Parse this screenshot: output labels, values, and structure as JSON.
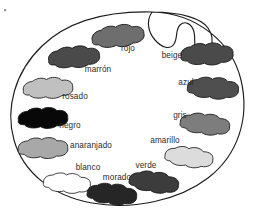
{
  "figure": {
    "name": "artist-paint-palette",
    "background_color": "#ffffff",
    "outline_color": "#1d1d1d",
    "body_fill": "#ffffff",
    "label_color": "#2b2b2b"
  },
  "paints": [
    {
      "id": "rojo",
      "label": "rojo",
      "swatch_color": "#6e6e6e",
      "outline_color": "#1a1a1a",
      "label_x": 128,
      "label_y": 51,
      "label_anchor": "middle",
      "blob_cx": 118,
      "blob_cy": 36,
      "blob_rot": -8,
      "blob_scale": 1.0
    },
    {
      "id": "marron",
      "label": "marrón",
      "swatch_color": "#4a4a4a",
      "outline_color": "#1a1a1a",
      "label_x": 98,
      "label_y": 72,
      "label_anchor": "middle",
      "blob_cx": 74,
      "blob_cy": 57,
      "blob_rot": -6,
      "blob_scale": 0.98
    },
    {
      "id": "rosado",
      "label": "rosado",
      "swatch_color": "#c0c0c0",
      "outline_color": "#1a1a1a",
      "label_x": 75,
      "label_y": 99,
      "label_anchor": "middle",
      "blob_cx": 48,
      "blob_cy": 88,
      "blob_rot": -4,
      "blob_scale": 0.95
    },
    {
      "id": "negro",
      "label": "negro",
      "swatch_color": "#080808",
      "outline_color": "#080808",
      "label_x": 70,
      "label_y": 128,
      "label_anchor": "middle",
      "blob_cx": 43,
      "blob_cy": 118,
      "blob_rot": -3,
      "blob_scale": 0.95
    },
    {
      "id": "anaranjado",
      "label": "anaranjado",
      "swatch_color": "#a8a8a8",
      "outline_color": "#1a1a1a",
      "label_x": 91,
      "label_y": 148,
      "label_anchor": "middle",
      "blob_cx": 43,
      "blob_cy": 148,
      "blob_rot": -2,
      "blob_scale": 0.95
    },
    {
      "id": "blanco",
      "label": "blanco",
      "swatch_color": "#ffffff",
      "outline_color": "#1a1a1a",
      "label_x": 88,
      "label_y": 170,
      "label_anchor": "middle",
      "blob_cx": 67,
      "blob_cy": 183,
      "blob_rot": 3,
      "blob_scale": 0.9
    },
    {
      "id": "morado",
      "label": "morado",
      "swatch_color": "#262626",
      "outline_color": "#1a1a1a",
      "label_x": 117,
      "label_y": 180,
      "label_anchor": "middle",
      "blob_cx": 112,
      "blob_cy": 194,
      "blob_rot": 4,
      "blob_scale": 0.95
    },
    {
      "id": "verde",
      "label": "verde",
      "swatch_color": "#3c3c3c",
      "outline_color": "#1a1a1a",
      "label_x": 146,
      "label_y": 168,
      "label_anchor": "middle",
      "blob_cx": 154,
      "blob_cy": 182,
      "blob_rot": 6,
      "blob_scale": 0.95
    },
    {
      "id": "amarillo",
      "label": "amarillo",
      "swatch_color": "#dcdcdc",
      "outline_color": "#1a1a1a",
      "label_x": 165,
      "label_y": 143,
      "label_anchor": "middle",
      "blob_cx": 189,
      "blob_cy": 157,
      "blob_rot": 5,
      "blob_scale": 0.92
    },
    {
      "id": "gris",
      "label": "gris",
      "swatch_color": "#7d7d7d",
      "outline_color": "#1a1a1a",
      "label_x": 180,
      "label_y": 118,
      "label_anchor": "middle",
      "blob_cx": 205,
      "blob_cy": 124,
      "blob_rot": 5,
      "blob_scale": 0.95
    },
    {
      "id": "azul",
      "label": "azul",
      "swatch_color": "#4f4f4f",
      "outline_color": "#1a1a1a",
      "label_x": 186,
      "label_y": 85,
      "label_anchor": "middle",
      "blob_cx": 213,
      "blob_cy": 88,
      "blob_rot": 2,
      "blob_scale": 0.98
    },
    {
      "id": "beige",
      "label": "beige",
      "swatch_color": "#4a4a4a",
      "outline_color": "#1a1a1a",
      "label_x": 172,
      "label_y": 58,
      "label_anchor": "middle",
      "blob_cx": 207,
      "blob_cy": 54,
      "blob_rot": -3,
      "blob_scale": 1.0
    }
  ],
  "speck": {
    "name": "corner-speck",
    "x": 4,
    "y": 9,
    "color": "#9a9a9a"
  }
}
